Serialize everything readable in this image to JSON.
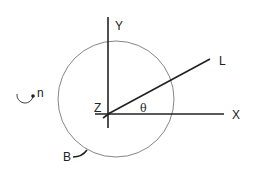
{
  "diagram": {
    "labels": {
      "y_axis": "Y",
      "x_axis": "X",
      "z_axis": "Z",
      "line": "L",
      "angle": "θ",
      "rotation": "n",
      "body": "B"
    },
    "colors": {
      "stroke": "#222222",
      "circle": "#777777",
      "background": "#ffffff"
    }
  }
}
